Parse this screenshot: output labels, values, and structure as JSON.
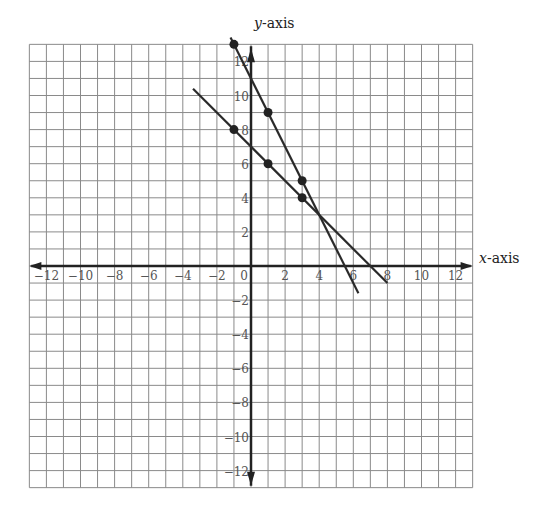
{
  "chart_data": {
    "type": "line",
    "title": "",
    "xlabel": "x-axis",
    "ylabel": "y-axis",
    "xlim": [
      -13,
      13
    ],
    "ylim": [
      -13,
      13
    ],
    "grid": true,
    "grid_step": 1,
    "x_ticks": [
      -12,
      -10,
      -8,
      -6,
      -4,
      -2,
      0,
      2,
      4,
      6,
      8,
      10,
      12
    ],
    "y_ticks": [
      -12,
      -10,
      -8,
      -6,
      -4,
      -2,
      2,
      4,
      6,
      8,
      10,
      12
    ],
    "x_tick_labels": [
      "−12",
      "−10",
      "−8",
      "−6",
      "−4",
      "−2",
      "0",
      "2",
      "4",
      "6",
      "8",
      "10",
      "12"
    ],
    "y_tick_labels": [
      "−12",
      "−10",
      "−8",
      "−6",
      "−4",
      "−2",
      "2",
      "4",
      "6",
      "8",
      "10",
      "12"
    ],
    "series": [
      {
        "name": "Line 1 (y = -2x + 11)",
        "segment": [
          [
            -1.2,
            13.4
          ],
          [
            6.3,
            -1.6
          ]
        ],
        "points": [
          [
            -1,
            13
          ],
          [
            1,
            9
          ],
          [
            3,
            5
          ]
        ]
      },
      {
        "name": "Line 2 (y = -x + 7)",
        "segment": [
          [
            -3.4,
            10.4
          ],
          [
            8.0,
            -1.0
          ]
        ],
        "points": [
          [
            -1,
            8
          ],
          [
            1,
            6
          ],
          [
            3,
            4
          ]
        ]
      }
    ],
    "intersection": [
      4,
      3
    ],
    "legend": null
  },
  "colors": {
    "grid": "#8a8a8a",
    "axis": "#222222",
    "line": "#2a2a2a",
    "point": "#222222"
  }
}
